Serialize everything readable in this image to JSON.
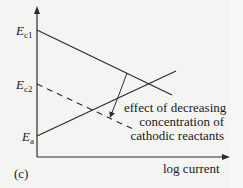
{
  "figure": {
    "panel_label": "(c)",
    "x_axis_label": "log current",
    "y_labels": {
      "ec1": {
        "symbol": "E",
        "subscript": "c1"
      },
      "ec2": {
        "symbol": "E",
        "subscript": "c2"
      },
      "ea": {
        "symbol": "E",
        "subscript": "a"
      }
    },
    "annotation": {
      "lines": [
        "effect of decreasing",
        "concentration of",
        "cathodic reactants"
      ]
    },
    "lines": [
      {
        "name": "cathodic-line-ec1",
        "style": "solid",
        "from": [
          37,
          30
        ],
        "to": [
          172,
          95
        ]
      },
      {
        "name": "cathodic-line-ec2",
        "style": "dashed",
        "from": [
          37,
          84
        ],
        "to": [
          135,
          130
        ]
      },
      {
        "name": "anodic-line-ea",
        "style": "solid",
        "from": [
          37,
          136
        ],
        "to": [
          176,
          71
        ]
      }
    ],
    "colors": {
      "line": "#2a2a2a",
      "background": "#f4f4f2"
    }
  }
}
